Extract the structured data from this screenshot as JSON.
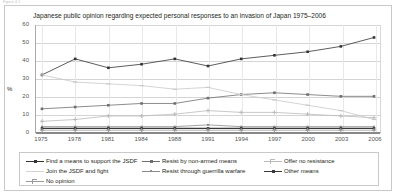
{
  "page": {
    "header_ghost_text": "Figure 4.1"
  },
  "chart_data": {
    "type": "line",
    "title": "Japanese public opinion regarding expected personal responses to an invasion of Japan 1975–2006",
    "xlabel": "",
    "ylabel": "%",
    "ylim": [
      0,
      60
    ],
    "yticks": [
      0,
      10,
      20,
      30,
      40,
      50,
      60
    ],
    "grid": true,
    "legend_position": "bottom",
    "categories": [
      "1975",
      "1978",
      "1981",
      "1984",
      "1988",
      "1991",
      "1994",
      "1997",
      "2000",
      "2003",
      "2006"
    ],
    "series": [
      {
        "name": "Find a means to support the JSDF",
        "marker": "filled-square",
        "color": "#333333",
        "values": [
          32,
          41,
          36,
          38,
          41,
          37,
          41,
          43,
          45,
          48,
          53
        ]
      },
      {
        "name": "Resist by non-armed means",
        "marker": "filled-square-mid",
        "color": "#6e6e6e",
        "values": [
          13,
          14,
          15,
          16,
          16,
          19,
          21,
          22,
          21,
          20,
          20
        ]
      },
      {
        "name": "Offer no resistance",
        "marker": "light-cross",
        "color": "#b9b9b9",
        "values": [
          6,
          7,
          9,
          9,
          10,
          12,
          11,
          11,
          10,
          9,
          8
        ]
      },
      {
        "name": "Join the JSDF and fight",
        "marker": "light-dash",
        "color": "#c9c9c9",
        "values": [
          32,
          28,
          27,
          26,
          24,
          25,
          21,
          18,
          15,
          12,
          7
        ]
      },
      {
        "name": "Resist through guerrilla warfare",
        "marker": "filled-square-small",
        "color": "#8a8a8a",
        "values": [
          3,
          3,
          3,
          3,
          3,
          4,
          3,
          3,
          3,
          3,
          3
        ]
      },
      {
        "name": "Other means",
        "marker": "filled-square-dark",
        "color": "#3a3a3a",
        "values": [
          2,
          2,
          2,
          2,
          2,
          2,
          2,
          2,
          2,
          2,
          2
        ]
      },
      {
        "name": "No opinion",
        "marker": "plus-cross",
        "color": "#9a9a9a",
        "values": [
          1,
          1,
          1,
          1,
          1,
          1,
          1,
          1,
          1,
          1,
          1
        ]
      }
    ]
  },
  "legend": {
    "entries": [
      {
        "label": "Find a means to support the JSDF",
        "col": 0,
        "row": 0
      },
      {
        "label": "Resist by non-armed means",
        "col": 1,
        "row": 0
      },
      {
        "label": "Offer no resistance",
        "col": 2,
        "row": 0
      },
      {
        "label": "Join the JSDF and fight",
        "col": 0,
        "row": 1
      },
      {
        "label": "Resist through guerrilla warfare",
        "col": 1,
        "row": 1
      },
      {
        "label": "Other means",
        "col": 2,
        "row": 1
      },
      {
        "label": "No opinion",
        "col": 0,
        "row": 2
      }
    ]
  }
}
